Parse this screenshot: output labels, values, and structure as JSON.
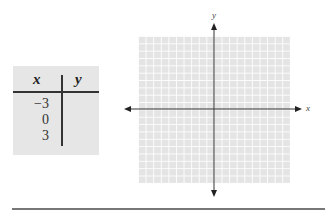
{
  "table": {
    "headers": [
      "x",
      "y"
    ],
    "rows": [
      {
        "x": "−3",
        "y": ""
      },
      {
        "x": "0",
        "y": ""
      },
      {
        "x": "3",
        "y": ""
      }
    ]
  },
  "graph": {
    "x_axis_label": "x",
    "y_axis_label": "y",
    "grid_cells": 20,
    "colors": {
      "grid_bg": "#e4e4e4",
      "grid_lines": "#ffffff",
      "axes": "#333333"
    }
  }
}
